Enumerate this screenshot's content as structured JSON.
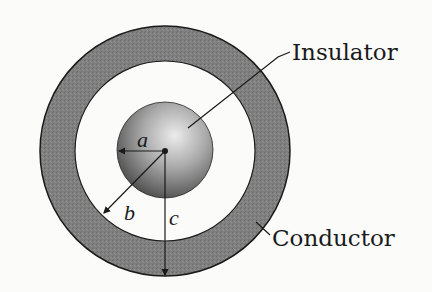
{
  "diagram": {
    "type": "concentric-sphere-cross-section",
    "labels": {
      "insulator": "Insulator",
      "conductor": "Conductor"
    },
    "radii_labels": {
      "a": "a",
      "b": "b",
      "c": "c"
    },
    "colors": {
      "background": "#fbfbfa",
      "conductor_shell": "#7d7d7d",
      "stroke": "#1a1a1a",
      "sphere_light": "#e2e2e2",
      "sphere_dark": "#4a4a4a"
    }
  }
}
